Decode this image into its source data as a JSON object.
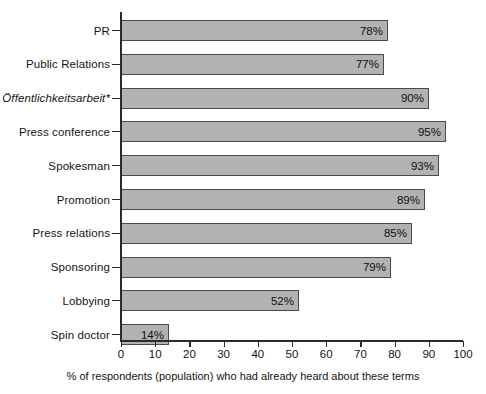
{
  "chart_data": {
    "type": "bar",
    "orientation": "horizontal",
    "title": "",
    "xlabel": "% of respondents (population) who had already heard about these terms",
    "ylabel": "",
    "xlim": [
      0,
      100
    ],
    "xticks": [
      0,
      10,
      20,
      30,
      40,
      50,
      60,
      70,
      80,
      90,
      100
    ],
    "xtick_labels": [
      "0",
      "10",
      "20",
      "30",
      "40",
      "50",
      "60",
      "70",
      "80",
      "90",
      "100"
    ],
    "grid": false,
    "legend": false,
    "value_label_suffix": "%",
    "bar_fill_color": "#b2b2b2",
    "bar_border_color": "#4a4a4a",
    "axis_color": "#2b2b2b",
    "background_color": "#ffffff",
    "categories": [
      "PR",
      "Public Relations",
      "Öffentlichkeitsarbeit*",
      "Press conference",
      "Spokesman",
      "Promotion",
      "Press relations",
      "Sponsoring",
      "Lobbying",
      "Spin doctor"
    ],
    "values": [
      78,
      77,
      90,
      95,
      93,
      89,
      85,
      79,
      52,
      14
    ],
    "value_labels": [
      "78%",
      "77%",
      "90%",
      "95%",
      "93%",
      "89%",
      "85%",
      "79%",
      "52%",
      "14%"
    ],
    "category_styles": [
      "normal",
      "normal",
      "italic",
      "normal",
      "normal",
      "normal",
      "normal",
      "normal",
      "normal",
      "normal"
    ]
  }
}
